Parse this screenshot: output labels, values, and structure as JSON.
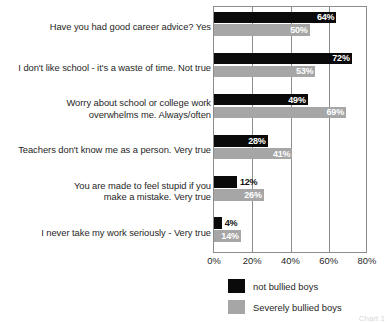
{
  "chart_data": {
    "type": "bar",
    "orientation": "horizontal",
    "title": "",
    "xlabel": "",
    "ylabel": "",
    "xlim": [
      0,
      80
    ],
    "xticks": [
      "0%",
      "20%",
      "40%",
      "60%",
      "80%"
    ],
    "xtick_values": [
      0,
      20,
      40,
      60,
      80
    ],
    "grid": true,
    "legend_position": "bottom",
    "categories": [
      {
        "lines": [
          "Have you had good career advice? Yes"
        ]
      },
      {
        "lines": [
          "I don't like school - it's a waste of time. Not true"
        ]
      },
      {
        "lines": [
          "Worry about school or college work",
          "overwhelms me. Always/often"
        ]
      },
      {
        "lines": [
          "Teachers don't know me as a person. Very true"
        ]
      },
      {
        "lines": [
          "You are made to feel stupid if you",
          "make a mistake. Very true"
        ]
      },
      {
        "lines": [
          "I never take my work seriously - Very true"
        ]
      }
    ],
    "series": [
      {
        "name": "not bullied boys",
        "color": "#0a0a0a",
        "values": [
          64,
          72,
          49,
          28,
          12,
          4
        ],
        "labels": [
          "64%",
          "72%",
          "49%",
          "28%",
          "12%",
          "4%"
        ]
      },
      {
        "name": "Severely bullied boys",
        "color": "#a6a6a6",
        "values": [
          50,
          53,
          69,
          41,
          26,
          14
        ],
        "labels": [
          "50%",
          "53%",
          "69%",
          "41%",
          "26%",
          "14%"
        ]
      }
    ]
  },
  "legend": {
    "items": [
      {
        "label": "not bullied boys",
        "color": "#0a0a0a"
      },
      {
        "label": "Severely bullied boys",
        "color": "#a6a6a6"
      }
    ]
  },
  "corner_caption": "Chart 1"
}
